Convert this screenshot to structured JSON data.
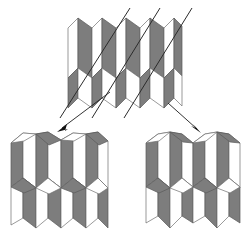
{
  "figure": {
    "background_color": "#ffffff",
    "colors": {
      "facet_light": "#ffffff",
      "facet_dark": "#7d7d7d",
      "facet_light_stroke": "#6f6f6f",
      "facet_dark_stroke": "#5a5a5a",
      "cut_line": "#2b2b2b",
      "arrow": "#111111"
    },
    "panels": [
      {
        "id": "top-pattern",
        "name": "unfolded-miura-sheet",
        "label": "",
        "position": "top-center",
        "column_count": 5,
        "row_count": 2,
        "cut_line_count": 3,
        "cut_line_angle_deg": -60
      },
      {
        "id": "bottom-left-pattern",
        "name": "folded-state-left",
        "label": "",
        "position": "bottom-left",
        "column_count": 2,
        "row_count": 2
      },
      {
        "id": "bottom-right-pattern",
        "name": "folded-state-right",
        "label": "",
        "position": "bottom-right",
        "column_count": 2,
        "row_count": 2
      }
    ],
    "arrows": [
      {
        "id": "arrow-left",
        "name": "arrow-to-left-state",
        "from": [
          108,
          94
        ],
        "to": [
          58,
          130
        ],
        "direction": "down-left"
      },
      {
        "id": "arrow-right",
        "name": "arrow-to-right-state",
        "from": [
          167,
          101
        ],
        "to": [
          196,
          130
        ],
        "direction": "down-right"
      }
    ],
    "cut_lines": [
      {
        "id": "cut-1",
        "x1": 130,
        "y1": 8,
        "x2": 60,
        "y2": 118
      },
      {
        "id": "cut-2",
        "x1": 160,
        "y1": 8,
        "x2": 92,
        "y2": 118
      },
      {
        "id": "cut-3",
        "x1": 192,
        "y1": 8,
        "x2": 124,
        "y2": 118
      }
    ]
  }
}
